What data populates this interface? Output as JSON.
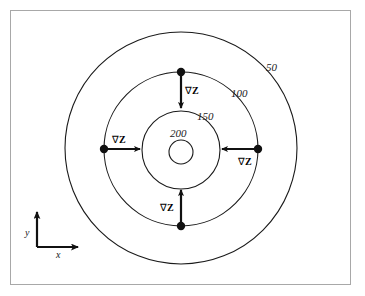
{
  "figure": {
    "background_color": "#ffffff",
    "frame_color": "#a8a8a8",
    "line_color": "#1a1a1a"
  },
  "contours": [
    {
      "label": "50",
      "radius": 116,
      "label_x": 266,
      "label_y": 62
    },
    {
      "label": "100",
      "radius": 77,
      "label_x": 231,
      "label_y": 88
    },
    {
      "label": "150",
      "radius": 39,
      "label_x": 197,
      "label_y": 111
    },
    {
      "label": "200",
      "radius": 12,
      "label_x": 170,
      "label_y": 128
    }
  ],
  "gradients": [
    {
      "id": "north",
      "label_nabla": "∇",
      "label_z": "Z",
      "label_x": 185,
      "label_y": 86,
      "dot_x": 181,
      "dot_y": 72,
      "tip_x": 181,
      "tip_y": 112
    },
    {
      "id": "west",
      "label_nabla": "∇",
      "label_z": "Z",
      "label_x": 112,
      "label_y": 135,
      "dot_x": 104,
      "dot_y": 149,
      "tip_x": 144,
      "tip_y": 149
    },
    {
      "id": "east",
      "label_nabla": "∇",
      "label_z": "Z",
      "label_x": 238,
      "label_y": 157,
      "dot_x": 258,
      "dot_y": 149,
      "tip_x": 218,
      "tip_y": 149
    },
    {
      "id": "south",
      "label_nabla": "∇",
      "label_z": "Z",
      "label_x": 160,
      "label_y": 203,
      "dot_x": 181,
      "dot_y": 226,
      "tip_x": 181,
      "tip_y": 186
    }
  ],
  "axes": {
    "origin_x": 37,
    "origin_y": 247,
    "y_label": "y",
    "y_label_x": 25,
    "y_label_y": 228,
    "y_tip_y": 208,
    "x_label": "x",
    "x_label_x": 56,
    "x_label_y": 253,
    "x_tip_x": 82
  }
}
